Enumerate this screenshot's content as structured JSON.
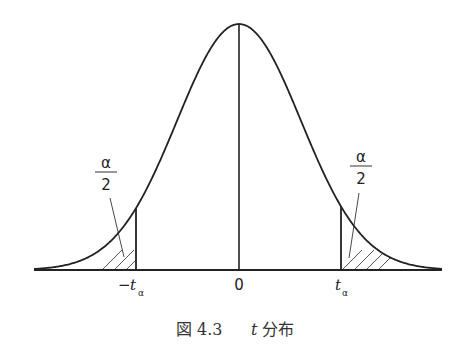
{
  "figure": {
    "caption_number": "図 4.3",
    "caption_var": "t",
    "caption_text": "分布"
  },
  "labels": {
    "left_fraction_num": "α",
    "left_fraction_den": "2",
    "right_fraction_num": "α",
    "right_fraction_den": "2",
    "left_tick_minus": "−",
    "left_tick_var": "t",
    "left_tick_sub": "α",
    "center_tick": "0",
    "right_tick_var": "t",
    "right_tick_sub": "α"
  },
  "colors": {
    "stroke": "#222222",
    "background": "#ffffff"
  }
}
